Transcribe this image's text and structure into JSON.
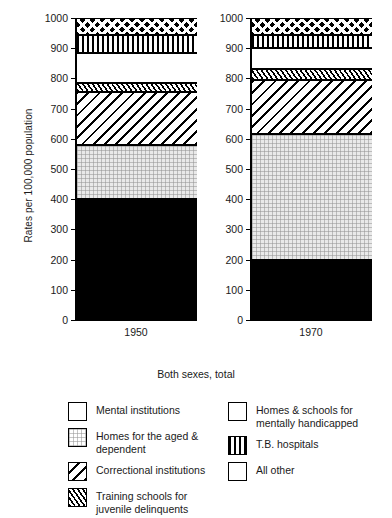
{
  "chart_data": {
    "type": "bar",
    "subtype": "stacked-bar-100-percent-rates",
    "title": "",
    "xlabel": "Both sexes, total",
    "ylabel": "Rates per 100,000 population",
    "categories": [
      "1950",
      "1970"
    ],
    "ylim": [
      0,
      1000
    ],
    "yticks": [
      0,
      100,
      200,
      300,
      400,
      500,
      600,
      700,
      800,
      900,
      1000
    ],
    "ytick_labels": [
      "0",
      "100",
      "200",
      "300",
      "400",
      "500",
      "600",
      "700",
      "800",
      "900",
      "1000"
    ],
    "grid": false,
    "legend_position": "below",
    "stack_order": "bottom-to-top",
    "series": [
      {
        "name": "Mental institutions",
        "pattern": "solid-black",
        "values": [
          400,
          200
        ],
        "cumulative_top": [
          400,
          200
        ]
      },
      {
        "name": "Homes for the aged & dependent",
        "pattern": "light-dotted-gray",
        "values": [
          180,
          415
        ],
        "cumulative_top": [
          580,
          615
        ]
      },
      {
        "name": "Correctional institutions",
        "pattern": "wide-diagonal-hatch",
        "values": [
          175,
          180
        ],
        "cumulative_top": [
          755,
          795
        ]
      },
      {
        "name": "Training schools for juvenile delinquents",
        "pattern": "dense-diagonal-hatch",
        "values": [
          30,
          35
        ],
        "cumulative_top": [
          785,
          830
        ]
      },
      {
        "name": "Homes & schools for mentally handicapped",
        "pattern": "white",
        "values": [
          100,
          70
        ],
        "cumulative_top": [
          885,
          900
        ]
      },
      {
        "name": "T.B. hospitals",
        "pattern": "vertical-lines",
        "values": [
          60,
          45
        ],
        "cumulative_top": [
          945,
          945
        ]
      },
      {
        "name": "All other",
        "pattern": "crosshatch",
        "values": [
          55,
          55
        ],
        "cumulative_top": [
          1000,
          1000
        ]
      }
    ],
    "totals": [
      1000,
      1000
    ]
  },
  "axis": {
    "ylabel": "Rates per 100,000 population",
    "ticks": [
      "1000",
      "900",
      "800",
      "700",
      "600",
      "500",
      "400",
      "300",
      "200",
      "100",
      "0"
    ]
  },
  "panels": [
    {
      "category": "1950"
    },
    {
      "category": "1970"
    }
  ],
  "caption": {
    "text": "Both sexes, total"
  },
  "legend": {
    "columns": [
      {
        "items": [
          {
            "label": "Mental institutions",
            "pattern": "solid-black"
          },
          {
            "label": "Homes for the aged &\ndependent",
            "pattern": "light-dotted-gray"
          },
          {
            "label": "Correctional institutions",
            "pattern": "wide-diagonal-hatch"
          },
          {
            "label": "Training schools for\njuvenile delinquents",
            "pattern": "dense-diagonal-hatch"
          }
        ]
      },
      {
        "items": [
          {
            "label": "Homes & schools for\nmentally handicapped",
            "pattern": "white"
          },
          {
            "label": "T.B. hospitals",
            "pattern": "vertical-lines"
          },
          {
            "label": "All other",
            "pattern": "crosshatch"
          }
        ]
      }
    ]
  },
  "colors": {
    "ink": "#000000",
    "background": "#ffffff",
    "gray_fill": "#e9e9e9"
  }
}
